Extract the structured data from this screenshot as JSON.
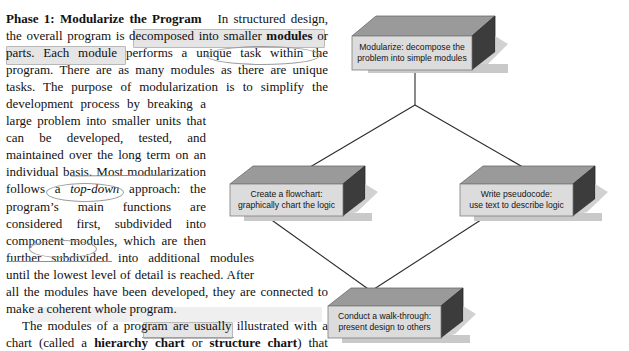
{
  "page": {
    "background_color": "#ffffff",
    "text_color": "#111111"
  },
  "article": {
    "paragraph_1": {
      "heading": "Phase 1: Modularize the Program",
      "segments": [
        "In structured design, the overall program is ",
        "decomposed into smaller ",
        "modules",
        " or parts.",
        " Each module performs ",
        "a unique task",
        " within the program. There are as many modules as there are unique tasks. The purpose of modularization is to simplify the development process by breaking a large problem into smaller units that can be developed, tested, and maintained over the long term on an individual basis. Most modularization follows ",
        "a ",
        "top-down",
        " approach: the program’s main functions are considered first, subdivided into component modules, which are then further ",
        "subdivided",
        " into additional modules until the lowest level of detail is reached. After all the modules have been developed, they are connected to make a coherent whole program."
      ],
      "full_text": "Phase 1: Modularize the Program   In structured design, the overall program is decomposed into smaller modules or parts. Each module performs a unique task within the program. There are as many modules as there are unique tasks. The purpose of modularization is to simplify the development process by breaking a large problem into smaller units that can be developed, tested, and maintained over the long term on an individual basis. Most modularization follows a top-down approach: the program’s main functions are considered first, subdivided into component modules, which are then further subdivided into additional modules until the lowest level of detail is reached. After all the modules have been developed, they are connected to make a coherent whole program."
    },
    "paragraph_2": {
      "full_text": "The modules of a program are usually illustrated with a chart (called a hierarchy chart or structure chart) that shows the overall purpose of the pro-",
      "bold_terms": [
        "hierarchy chart",
        "structure chart"
      ]
    }
  },
  "annotations": {
    "highlight_boxes": [
      {
        "name": "highlight-decomposed-into-smaller-modules",
        "text": "decomposed into smaller mod-ules or parts."
      },
      {
        "name": "highlight-hierarchy-chart",
        "text": "hierarchy chart"
      }
    ],
    "circles": [
      {
        "name": "circle-a-unique-task",
        "text": "a unique task"
      },
      {
        "name": "circle-a-top-down",
        "text": "a top-down"
      },
      {
        "name": "circle-subdivided",
        "text": "subdivided"
      }
    ],
    "strikethroughs": [
      {
        "name": "strike-most-modularization",
        "text": "Most modularization"
      },
      {
        "name": "strike-the-lowest-level-of",
        "text": "the lowest level of"
      }
    ]
  },
  "diagram": {
    "style": {
      "face_color": "#dcdcdc",
      "top_color": "#9a9a9a",
      "side_color": "#3c3c3c",
      "shadow_color": "#c9c9c9",
      "line_color": "#2b2b2b"
    },
    "blocks": [
      {
        "id": "modularize",
        "name": "block-modularize",
        "line1": "Modularize: decompose the",
        "line2": "problem into simple modules",
        "label": "Modularize: decompose the\nproblem into simple modules"
      },
      {
        "id": "flowchart",
        "name": "block-create-flowchart",
        "line1": "Create a flowchart:",
        "line2": "graphically chart the logic",
        "label": "Create a flowchart:\ngraphically chart the logic"
      },
      {
        "id": "pseudocode",
        "name": "block-write-pseudocode",
        "line1": "Write pseudocode:",
        "line2": "use text to describe logic",
        "label": "Write pseudocode:\nuse text to describe logic"
      },
      {
        "id": "walkthrough",
        "name": "block-conduct-walkthrough",
        "line1": "Conduct a walk-through:",
        "line2": "present design to others",
        "label": "Conduct a walk-through:\npresent design to others"
      }
    ],
    "connectors": [
      {
        "name": "connector-modularize-to-branch",
        "from": "modularize",
        "to": "branch-point"
      },
      {
        "name": "connector-branch-to-flowchart",
        "from": "branch-point",
        "to": "flowchart"
      },
      {
        "name": "connector-branch-to-pseudocode",
        "from": "branch-point",
        "to": "pseudocode"
      },
      {
        "name": "connector-flowchart-to-walkthrough",
        "from": "flowchart",
        "to": "walkthrough"
      },
      {
        "name": "connector-pseudocode-to-walkthrough",
        "from": "pseudocode",
        "to": "walkthrough"
      }
    ]
  }
}
